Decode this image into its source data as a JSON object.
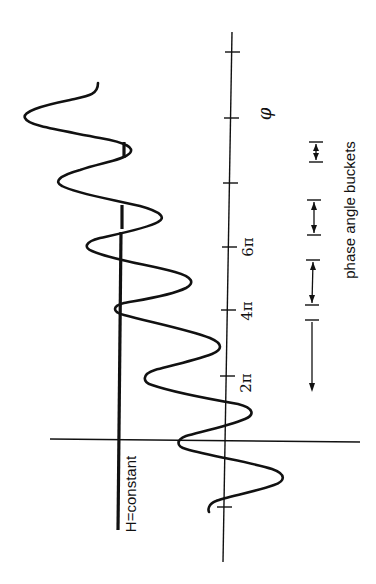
{
  "figure": {
    "orientation": "rotated -90deg (phi axis runs bottom-to-top)",
    "axis": {
      "label": "φ",
      "tick_labels": [
        "2π",
        "4π",
        "6π"
      ]
    },
    "h_line": {
      "label": "H=constant"
    },
    "buckets": {
      "label": "phase angle buckets",
      "count": 4
    },
    "colors": {
      "ink": "#111111",
      "background": "#ffffff"
    }
  }
}
